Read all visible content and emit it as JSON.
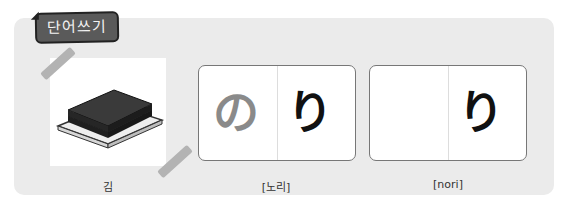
{
  "header": {
    "title": "단어쓰기"
  },
  "image_card": {
    "icon": "stacked-seaweed-sheets-icon",
    "caption": "김"
  },
  "card_1": {
    "left_kana": "の",
    "right_kana": "り",
    "caption": "[노리]"
  },
  "card_2": {
    "left_kana": "",
    "right_kana": "り",
    "caption": "[nori]"
  },
  "colors": {
    "panel": "#ebebeb",
    "tag": "#5a5a5a",
    "tape": "#b3b3b3",
    "hint_kana": "#8a8a8a"
  }
}
